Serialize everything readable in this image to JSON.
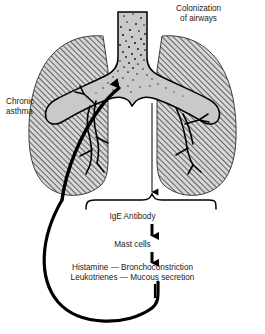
{
  "diagram": {
    "labels": {
      "colonization_line1": "Colonization",
      "colonization_line2": "of airways",
      "chronic_line1": "Chronic",
      "chronic_line2": "asthma",
      "ige_antibody": "IgE Antibody",
      "mast_cells": "Mast cells",
      "mediator_line1": "Histamine — Bronchoconstriction",
      "mediator_line2": "Leukotrienes — Mucous secretion"
    },
    "anatomy": {
      "trachea": "trachea-with-colonization",
      "left_lung": "left-lung-hatched",
      "right_lung": "right-lung-hatched",
      "bronchi": "bronchial-tree"
    },
    "colors": {
      "lung_fill": "#d6d6d6",
      "hatch_line": "#3a3a3a",
      "airway_fill": "#c9c9c9",
      "stipple": "#111111",
      "stroke": "#000000",
      "text": "#1a1a1a",
      "background": "#ffffff"
    }
  }
}
